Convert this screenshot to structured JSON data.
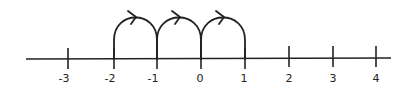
{
  "diagram": {
    "type": "number-line",
    "axis": {
      "min": -3,
      "max": 4,
      "step": 1
    },
    "ticks": [
      {
        "value": -3,
        "label": "-3",
        "x": 68
      },
      {
        "value": -2,
        "label": "-2",
        "x": 114
      },
      {
        "value": -1,
        "label": "-1",
        "x": 157
      },
      {
        "value": 0,
        "label": "0",
        "x": 201
      },
      {
        "value": 1,
        "label": "1",
        "x": 245
      },
      {
        "value": 2,
        "label": "2",
        "x": 289
      },
      {
        "value": 3,
        "label": "3",
        "x": 333
      },
      {
        "value": 4,
        "label": "4",
        "x": 376
      }
    ],
    "jumps": [
      {
        "from": -2,
        "to": -1,
        "direction": "right"
      },
      {
        "from": -1,
        "to": 0,
        "direction": "right"
      },
      {
        "from": 0,
        "to": 1,
        "direction": "right"
      }
    ],
    "colors": {
      "ink": "#222222",
      "background": "#ffffff"
    }
  }
}
